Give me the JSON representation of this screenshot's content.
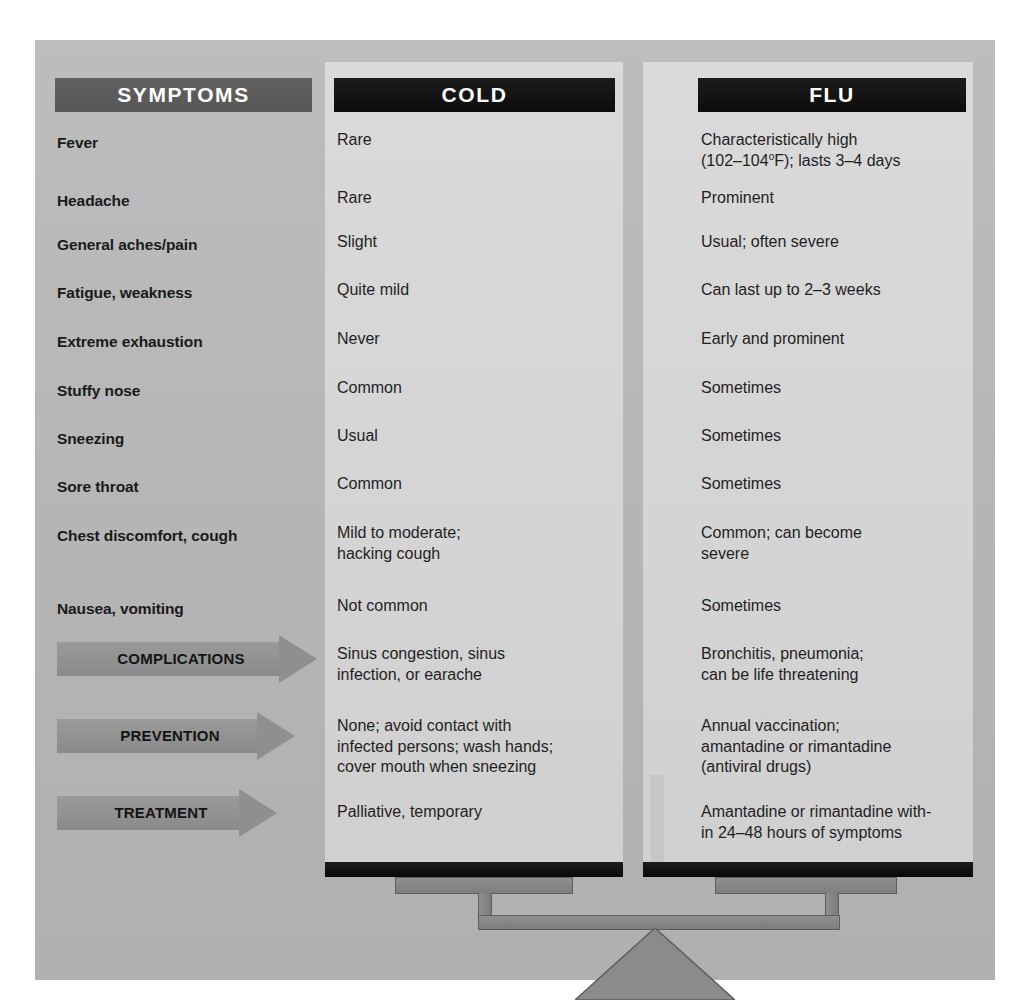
{
  "headers": {
    "symptoms": "SYMPTOMS",
    "cold": "COLD",
    "flu": "FLU"
  },
  "symptom_rows": [
    {
      "label": "Fever",
      "cold": "Rare",
      "flu": "Characteristically high\n(102–104°F); lasts 3–4 days"
    },
    {
      "label": "Headache",
      "cold": "Rare",
      "flu": "Prominent"
    },
    {
      "label": "General aches/pain",
      "cold": "Slight",
      "flu": "Usual; often severe"
    },
    {
      "label": "Fatigue, weakness",
      "cold": "Quite mild",
      "flu": "Can last up to 2–3 weeks"
    },
    {
      "label": "Extreme exhaustion",
      "cold": "Never",
      "flu": "Early and prominent"
    },
    {
      "label": "Stuffy nose",
      "cold": "Common",
      "flu": "Sometimes"
    },
    {
      "label": "Sneezing",
      "cold": "Usual",
      "flu": "Sometimes"
    },
    {
      "label": "Sore throat",
      "cold": "Common",
      "flu": "Sometimes"
    },
    {
      "label": "Chest discomfort, cough",
      "cold": "Mild to moderate;\nhacking cough",
      "flu": "Common; can become\nsevere"
    },
    {
      "label": "Nausea, vomiting",
      "cold": "Not common",
      "flu": "Sometimes"
    }
  ],
  "arrow_rows": [
    {
      "label": "COMPLICATIONS",
      "cold": "Sinus congestion, sinus\ninfection, or earache",
      "flu": "Bronchitis, pneumonia;\ncan be life threatening"
    },
    {
      "label": "PREVENTION",
      "cold": "None; avoid contact with\ninfected persons; wash hands;\ncover mouth when sneezing",
      "flu": "Annual vaccination;\namantadine or rimantadine\n(antiviral drugs)"
    },
    {
      "label": "TREATMENT",
      "cold": "Palliative, temporary",
      "flu": "Amantadine or rimantadine with-\nin 24–48 hours of symptoms"
    }
  ],
  "colors": {
    "frame_background": "#b9b9b9",
    "panel_background": "#d7d7d7",
    "symptoms_header_bar": "#595959",
    "column_header_bar": "#121212",
    "arrow_band": "#8f8f8f",
    "scale_pan_black": "#111111",
    "scale_metal_gray": "#858585",
    "text_primary": "#1f1f1f",
    "header_text": "#ffffff"
  },
  "graphic": {
    "name": "balance-scale",
    "description": "two-pan balance supporting the COLD and FLU columns"
  }
}
